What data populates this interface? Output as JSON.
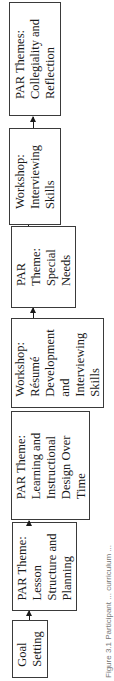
{
  "diagram": {
    "type": "flowchart",
    "orientation": "rotated-90-ccw",
    "steps": [
      {
        "id": "goal-setting",
        "label": "Goal\nSetting"
      },
      {
        "id": "par-lesson",
        "label": "PAR Theme:\nLesson\nStructure and\nPlanning"
      },
      {
        "id": "par-learning",
        "label": "PAR Theme:\nLearning and\nInstructional\nDesign Over\nTime"
      },
      {
        "id": "workshop-resume",
        "label": "Workshop:\nRésumé\nDevelopment\nand\nInterviewing\nSkills"
      },
      {
        "id": "par-special",
        "label": "PAR\nTheme:\nSpecial\nNeeds"
      },
      {
        "id": "workshop-interviewing",
        "label": "Workshop:\nInterviewing\nSkills"
      },
      {
        "id": "par-collegiality",
        "label": "PAR Themes:\nCollegiality and\nReflection"
      }
    ],
    "caption": "Figure 3.1 Participant ... curriculum ..."
  }
}
